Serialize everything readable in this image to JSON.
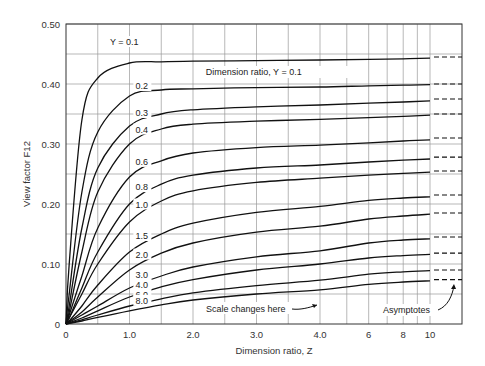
{
  "chart_data": {
    "type": "line",
    "title": "",
    "xlabel": "Dimension ratio, Z",
    "ylabel": "View factor F12",
    "ylim": [
      0,
      0.5
    ],
    "xlim": [
      0,
      10
    ],
    "grid": true,
    "x_ticks": [
      "0",
      "1.0",
      "2.0",
      "3.0",
      "4.0",
      "6",
      "8",
      "10"
    ],
    "y_ticks": [
      "0",
      "0.10",
      "0.20",
      "0.30",
      "0.40",
      "0.50"
    ],
    "x": [
      0.05,
      0.25,
      0.5,
      1.0,
      1.5,
      2.0,
      3.0,
      4.0,
      6.0,
      8.0,
      10.0
    ],
    "series": [
      {
        "name": "Y = 0.1",
        "values": [
          0.1,
          0.34,
          0.41,
          0.435,
          0.437,
          0.438,
          0.439,
          0.44,
          0.441,
          0.442,
          0.443
        ],
        "asymptote": 0.445
      },
      {
        "name": "0.2",
        "values": [
          0.05,
          0.22,
          0.32,
          0.38,
          0.39,
          0.392,
          0.394,
          0.395,
          0.397,
          0.398,
          0.399
        ],
        "asymptote": 0.4
      },
      {
        "name": "0.3",
        "values": [
          0.03,
          0.16,
          0.26,
          0.33,
          0.35,
          0.357,
          0.362,
          0.365,
          0.368,
          0.37,
          0.372
        ],
        "asymptote": 0.375
      },
      {
        "name": "0.4",
        "values": [
          0.02,
          0.12,
          0.22,
          0.3,
          0.325,
          0.333,
          0.338,
          0.341,
          0.344,
          0.346,
          0.348
        ],
        "asymptote": 0.35
      },
      {
        "name": "0.6",
        "values": [
          0.015,
          0.08,
          0.16,
          0.245,
          0.272,
          0.285,
          0.294,
          0.298,
          0.302,
          0.305,
          0.307
        ],
        "asymptote": 0.31
      },
      {
        "name": "0.8",
        "values": [
          0.01,
          0.06,
          0.12,
          0.2,
          0.233,
          0.248,
          0.26,
          0.265,
          0.27,
          0.273,
          0.275
        ],
        "asymptote": 0.278
      },
      {
        "name": "1.0",
        "values": [
          0.01,
          0.05,
          0.1,
          0.17,
          0.205,
          0.222,
          0.236,
          0.243,
          0.248,
          0.251,
          0.253
        ],
        "asymptote": 0.255
      },
      {
        "name": "1.5",
        "values": [
          0.005,
          0.03,
          0.065,
          0.12,
          0.15,
          0.168,
          0.186,
          0.196,
          0.206,
          0.21,
          0.212
        ],
        "asymptote": 0.215
      },
      {
        "name": "2.0",
        "values": [
          0.004,
          0.02,
          0.045,
          0.09,
          0.118,
          0.135,
          0.153,
          0.163,
          0.175,
          0.18,
          0.183
        ],
        "asymptote": 0.185
      },
      {
        "name": "3.0",
        "values": [
          0.003,
          0.015,
          0.03,
          0.06,
          0.08,
          0.095,
          0.112,
          0.122,
          0.135,
          0.14,
          0.142
        ],
        "asymptote": 0.145
      },
      {
        "name": "4.0",
        "values": [
          0.002,
          0.01,
          0.022,
          0.045,
          0.062,
          0.074,
          0.09,
          0.1,
          0.11,
          0.114,
          0.116
        ],
        "asymptote": 0.118
      },
      {
        "name": "6.0",
        "values": [
          0.001,
          0.007,
          0.015,
          0.03,
          0.042,
          0.052,
          0.064,
          0.073,
          0.083,
          0.087,
          0.089
        ],
        "asymptote": 0.09
      },
      {
        "name": "8.0",
        "values": [
          0.001,
          0.005,
          0.011,
          0.022,
          0.032,
          0.04,
          0.05,
          0.057,
          0.066,
          0.07,
          0.072
        ],
        "asymptote": 0.074
      }
    ],
    "annotations": [
      {
        "text": "Dimension ratio, Y = 0.1"
      },
      {
        "text": "Scale changes here"
      },
      {
        "text": "Asymptotes"
      }
    ],
    "curve_labels": [
      "Y = 0.1",
      "0.2",
      "0.3",
      "0.4",
      "0.6",
      "0.8",
      "1.0",
      "1.5",
      "2.0",
      "3.0",
      "4.0",
      "6.0",
      "8.0"
    ]
  }
}
